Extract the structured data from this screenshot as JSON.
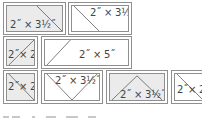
{
  "pieces": [
    {
      "row": 1,
      "shape": "trapezoid-left",
      "fill": "gray",
      "label": "2˝ × 3½˝"
    },
    {
      "row": 1,
      "shape": "trapezoid-right",
      "fill": "white",
      "label": "2˝ × 3½˝"
    },
    {
      "row": 2,
      "shape": "half-square-triangle",
      "fill": "gray",
      "label": "2˝× 2˝"
    },
    {
      "row": 2,
      "shape": "parallelogram",
      "fill": "white",
      "label": "2˝ × 5˝"
    },
    {
      "row": 3,
      "shape": "half-square-triangle",
      "fill": "gray",
      "label": "2˝× 2˝"
    },
    {
      "row": 3,
      "shape": "flying-goose-down",
      "fill": "white",
      "label": "2˝ × 3½˝"
    },
    {
      "row": 3,
      "shape": "flying-goose-up",
      "fill": "gray",
      "label": "2˝ × 3½˝"
    },
    {
      "row": 3,
      "shape": "half-square-triangle",
      "fill": "white",
      "label": "2˝× 2˝"
    }
  ],
  "colors": {
    "line": "#8f8f8f",
    "gray_fill": "#ebebeb",
    "text": "#444444"
  }
}
